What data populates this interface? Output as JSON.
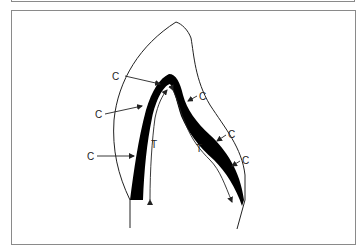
{
  "figure": {
    "type": "diagram",
    "labels": {
      "compression": "C",
      "tension": "T"
    },
    "c_labels": [
      {
        "text": "C",
        "x": 117,
        "y": 77
      },
      {
        "text": "C",
        "x": 97,
        "y": 116
      },
      {
        "text": "C",
        "x": 89,
        "y": 158
      },
      {
        "text": "C",
        "x": 199,
        "y": 99
      },
      {
        "text": "C",
        "x": 228,
        "y": 137
      },
      {
        "text": "C",
        "x": 242,
        "y": 163
      }
    ],
    "t_labels": [
      {
        "text": "T",
        "x": 151,
        "y": 146
      },
      {
        "text": "T",
        "x": 196,
        "y": 152
      }
    ],
    "colors": {
      "band": "#000000",
      "outline": "#222222",
      "frame": "#8a8a8a"
    }
  }
}
